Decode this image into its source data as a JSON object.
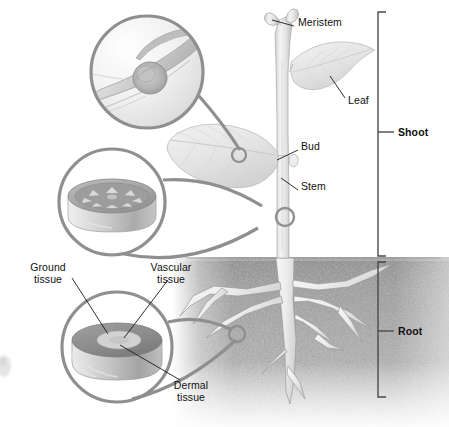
{
  "figure": {
    "width": 449,
    "height": 427,
    "background_color": "#ffffff",
    "line_color": "#8a8a8a",
    "leader_color": "#1a1a1a",
    "soil_color": "#9a9a9a",
    "plant_color": "#d8d8d8"
  },
  "labels": {
    "meristem": {
      "text": "Meristem",
      "x": 298,
      "y": 22,
      "bold": false
    },
    "leaf": {
      "text": "Leaf",
      "x": 348,
      "y": 100,
      "bold": false
    },
    "bud": {
      "text": "Bud",
      "x": 301,
      "y": 146,
      "bold": false
    },
    "stem": {
      "text": "Stem",
      "x": 301,
      "y": 186,
      "bold": false
    },
    "shoot": {
      "text": "Shoot",
      "x": 400,
      "y": 126,
      "bold": true
    },
    "root": {
      "text": "Root",
      "x": 400,
      "y": 325,
      "bold": true
    },
    "ground_tissue": {
      "text": "Ground\ntissue",
      "x": 18,
      "y": 265,
      "bold": false
    },
    "vascular_tissue": {
      "text": "Vascular\ntissue",
      "x": 140,
      "y": 265,
      "bold": false
    },
    "dermal_tissue": {
      "text": "Dermal\ntissue",
      "x": 163,
      "y": 383,
      "bold": false
    }
  },
  "brackets": [
    {
      "name": "shoot-bracket",
      "label": "Shoot",
      "top": 12,
      "bottom": 256,
      "tick_y": 132
    },
    {
      "name": "root-bracket",
      "label": "Root",
      "top": 262,
      "bottom": 397,
      "tick_y": 331
    }
  ],
  "callouts": [
    {
      "name": "bud-cross-section",
      "label": "bud magnification",
      "cx": 147,
      "cy": 72,
      "r": 57,
      "target_x": 239,
      "target_y": 154
    },
    {
      "name": "stem-cross-section",
      "label": "stem magnification",
      "cx": 112,
      "cy": 202,
      "r": 54,
      "target_x": 285,
      "target_y": 217
    },
    {
      "name": "root-cross-section",
      "label": "root magnification",
      "cx": 117,
      "cy": 347,
      "r": 56,
      "target_x": 237,
      "target_y": 334
    }
  ],
  "plant": {
    "soil_line_y": 257,
    "stem_x": 285,
    "apex_y": 16,
    "upper_leaf": "leaf attached on right side of upper stem",
    "lower_leaf": "large leaf attached on left side of mid stem",
    "root_type": "taproot with lateral branches"
  }
}
